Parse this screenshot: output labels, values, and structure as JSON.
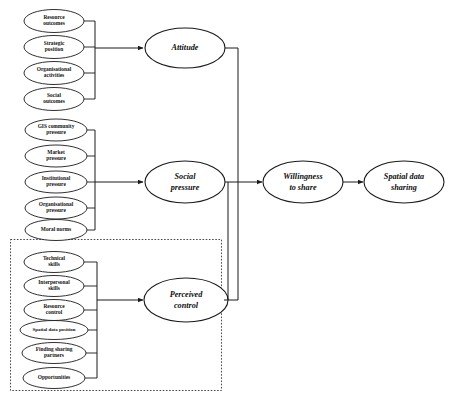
{
  "diagram": {
    "type": "path-diagram",
    "background_color": "#ffffff",
    "line_color": "#1a1a1a",
    "groups": [
      {
        "id": "attitude-group",
        "construct": "Attitude",
        "indicators": [
          "Resource outcomes",
          "Strategic position",
          "Organisational activities",
          "Social outcomes"
        ]
      },
      {
        "id": "social-pressure-group",
        "construct": "Social pressure",
        "indicators": [
          "GIS community pressure",
          "Market pressure",
          "Institutional pressure",
          "Organisational pressure",
          "Moral norms"
        ]
      },
      {
        "id": "perceived-control-group",
        "construct": "Perceived control",
        "boundary": "dotted",
        "indicators": [
          "Technical skills",
          "Interpersonal skills",
          "Resource control",
          "Spatial data position",
          "Finding sharing partners",
          "Opportunities"
        ]
      }
    ],
    "outcomes": [
      {
        "id": "willingness",
        "label": "Willingness to share"
      },
      {
        "id": "sharing",
        "label": "Spatial data sharing"
      }
    ],
    "labels": {
      "indicator_1_1": "Resource outcomes",
      "indicator_1_2": "Strategic position",
      "indicator_1_3": "Organisational activities",
      "indicator_1_4": "Social outcomes",
      "indicator_2_1": "GIS community pressure",
      "indicator_2_2": "Market pressure",
      "indicator_2_3": "Institutional pressure",
      "indicator_2_4": "Organisational pressure",
      "indicator_2_5": "Moral norms",
      "indicator_3_1": "Technical skills",
      "indicator_3_2": "Interpersonal skills",
      "indicator_3_3": "Resource control",
      "indicator_3_4": "Spatial data position",
      "indicator_3_5": "Finding sharing partners",
      "indicator_3_6": "Opportunities",
      "construct_attitude_line1": "Attitude",
      "construct_social_line1": "Social",
      "construct_social_line2": "pressure",
      "construct_control_line1": "Perceived",
      "construct_control_line2": "control",
      "outcome_willingness_line1": "Willingness",
      "outcome_willingness_line2": "to share",
      "outcome_sharing_line1": "Spatial data",
      "outcome_sharing_line2": "sharing"
    }
  }
}
